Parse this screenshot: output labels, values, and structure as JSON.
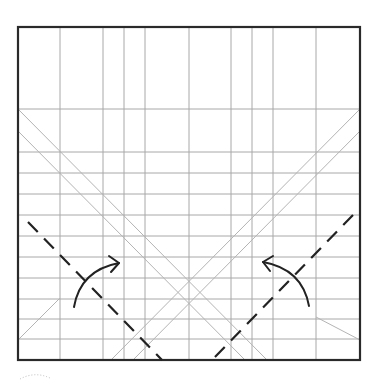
{
  "diagram": {
    "colors": {
      "border": "#2a2a2a",
      "grid": "#a8a8a8",
      "valley_fold": "#222222",
      "arrow": "#222222"
    },
    "paper": {
      "x0": 18,
      "y0": 27,
      "x1": 360,
      "y1": 360
    },
    "vertical_creases_x": [
      60,
      103,
      124,
      145,
      189,
      231,
      252,
      273,
      316
    ],
    "horizontal_creases_y": [
      109,
      152,
      173,
      194,
      215,
      236,
      257,
      278,
      299,
      319,
      339
    ],
    "diagonal_creases": [
      {
        "from": [
          18,
          109
        ],
        "to": [
          267,
          360
        ]
      },
      {
        "from": [
          18,
          131
        ],
        "to": [
          245,
          360
        ]
      },
      {
        "from": [
          360,
          109
        ],
        "to": [
          111,
          360
        ]
      },
      {
        "from": [
          360,
          131
        ],
        "to": [
          133,
          360
        ]
      },
      {
        "from": [
          18,
          340
        ],
        "to": [
          60,
          298
        ]
      },
      {
        "from": [
          316,
          317
        ],
        "to": [
          360,
          340
        ]
      }
    ],
    "valley_folds": [
      {
        "name": "left-valley-fold",
        "from": [
          28,
          222
        ],
        "to": [
          162,
          360
        ]
      },
      {
        "name": "right-valley-fold",
        "from": [
          353,
          215
        ],
        "to": [
          212,
          360
        ]
      }
    ],
    "arrows": [
      {
        "name": "left-fold-arrow",
        "direction": "up-right",
        "from": [
          74,
          307
        ],
        "to": [
          119,
          263
        ]
      },
      {
        "name": "right-fold-arrow",
        "direction": "up-left",
        "from": [
          309,
          306
        ],
        "to": [
          263,
          262
        ]
      }
    ]
  }
}
